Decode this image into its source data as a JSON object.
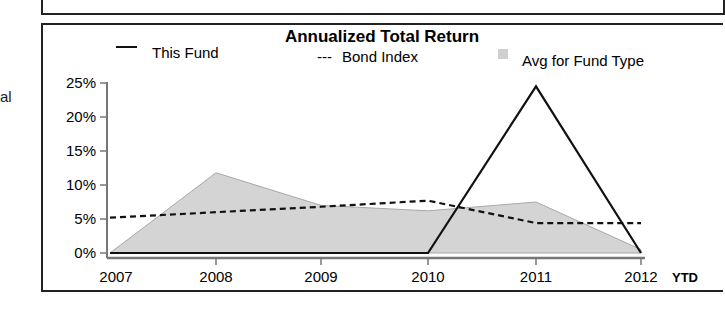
{
  "page": {
    "left_cut_text": "al"
  },
  "chart_data": {
    "type": "line",
    "title": "Annualized Total Return",
    "xlabel": "",
    "ylabel": "",
    "categories": [
      "2007",
      "2008",
      "2009",
      "2010",
      "2011",
      "2012"
    ],
    "x_suffix_label": "YTD",
    "y_ticks": [
      "0%",
      "5%",
      "10%",
      "15%",
      "20%",
      "25%"
    ],
    "ylim": [
      0,
      25
    ],
    "grid": false,
    "legend_position": "top",
    "legend": [
      {
        "name": "This Fund",
        "marker": "—",
        "style": "solid line"
      },
      {
        "name": "Bond Index",
        "marker": "---",
        "style": "dashed line"
      },
      {
        "name": "Avg for Fund Type",
        "marker": "▒",
        "style": "shaded area"
      }
    ],
    "series": [
      {
        "name": "This Fund",
        "type": "line",
        "values": [
          0,
          0,
          0,
          0,
          24.5,
          0
        ]
      },
      {
        "name": "Bond Index",
        "type": "dashed-line",
        "values": [
          5.2,
          6.0,
          6.8,
          7.7,
          4.4,
          4.4
        ]
      },
      {
        "name": "Avg for Fund Type",
        "type": "area",
        "values": [
          0,
          11.8,
          7.0,
          6.2,
          7.5,
          0.5
        ]
      }
    ],
    "colors": {
      "fund_line": "#111111",
      "bond_line": "#111111",
      "area_fill": "#d4d4d4",
      "area_edge": "#a8a8a8",
      "axis": "#777777"
    }
  }
}
